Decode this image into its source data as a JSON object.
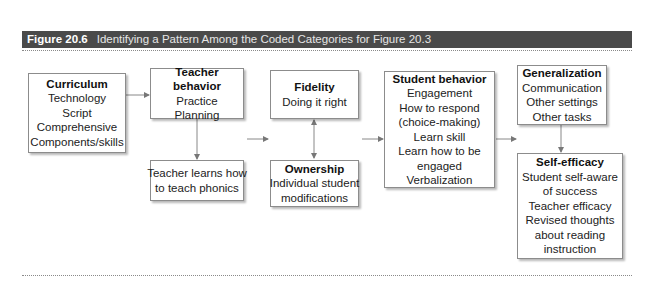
{
  "header": {
    "figure_number": "Figure 20.6",
    "figure_title": "Identifying a Pattern Among the Coded Categories for Figure 20.3",
    "background_color": "#4a4a4a"
  },
  "diagram": {
    "boxes": {
      "curriculum": {
        "title": "Curriculum",
        "lines": [
          "Technology",
          "Script",
          "Comprehensive",
          "Components/skills"
        ]
      },
      "teacher_behavior": {
        "title": "Teacher behavior",
        "lines": [
          "Practice",
          "Planning"
        ]
      },
      "teacher_learns": {
        "title": "",
        "lines": [
          "Teacher learns how",
          "to teach phonics"
        ]
      },
      "fidelity": {
        "title": "Fidelity",
        "lines": [
          "Doing it right"
        ]
      },
      "ownership": {
        "title": "Ownership",
        "lines": [
          "Individual student",
          "modifications"
        ]
      },
      "student_behavior": {
        "title": "Student behavior",
        "lines": [
          "Engagement",
          "How to respond",
          "(choice-making)",
          "Learn skill",
          "Learn how to be",
          "engaged",
          "Verbalization"
        ]
      },
      "generalization": {
        "title": "Generalization",
        "lines": [
          "Communication",
          "Other settings",
          "Other tasks"
        ]
      },
      "self_efficacy": {
        "title": "Self-efficacy",
        "lines": [
          "Student self-aware",
          "of success",
          "Teacher efficacy",
          "Revised thoughts",
          "about reading",
          "instruction"
        ]
      }
    },
    "edges": [
      {
        "from": "curriculum",
        "to": "teacher_behavior",
        "type": "arrow"
      },
      {
        "from": "teacher_behavior",
        "to": "teacher_learns",
        "type": "arrow"
      },
      {
        "from": "teacher_column",
        "to": "fidelity_column",
        "type": "arrow"
      },
      {
        "from": "fidelity",
        "to": "ownership",
        "type": "bidirectional"
      },
      {
        "from": "fidelity_column",
        "to": "student_behavior",
        "type": "arrow"
      },
      {
        "from": "student_behavior",
        "to": "right_column",
        "type": "arrow"
      },
      {
        "from": "generalization",
        "to": "self_efficacy",
        "type": "arrow"
      }
    ]
  }
}
